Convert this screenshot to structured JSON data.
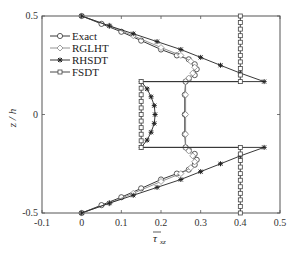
{
  "chart_data": {
    "type": "line",
    "title": "",
    "xlabel": "τ̄xz",
    "ylabel": "z / h",
    "xlim": [
      -0.1,
      0.5
    ],
    "ylim": [
      -0.5,
      0.5
    ],
    "x_ticks": [
      "-0.1",
      "0",
      "0.1",
      "0.2",
      "0.3",
      "0.4",
      "0.5"
    ],
    "y_ticks": [
      "0.5",
      "0",
      "-0.5"
    ],
    "grid": false,
    "legend_position": "upper left",
    "series": [
      {
        "name": "Exact",
        "marker": "circle",
        "points": [
          [
            0,
            0.5
          ],
          [
            0.05,
            0.46
          ],
          [
            0.1,
            0.42
          ],
          [
            0.15,
            0.375
          ],
          [
            0.2,
            0.33
          ],
          [
            0.24,
            0.3
          ],
          [
            0.27,
            0.28
          ],
          [
            0.285,
            0.255
          ],
          [
            0.29,
            0.23
          ],
          [
            0.285,
            0.2
          ],
          [
            0.27,
            0.18
          ],
          [
            0.262,
            0.167
          ],
          [
            0.26,
            0.1
          ],
          [
            0.26,
            0.0
          ],
          [
            0.26,
            -0.1
          ],
          [
            0.262,
            -0.167
          ],
          [
            0.27,
            -0.18
          ],
          [
            0.285,
            -0.2
          ],
          [
            0.29,
            -0.23
          ],
          [
            0.285,
            -0.255
          ],
          [
            0.27,
            -0.28
          ],
          [
            0.24,
            -0.3
          ],
          [
            0.2,
            -0.33
          ],
          [
            0.15,
            -0.375
          ],
          [
            0.1,
            -0.42
          ],
          [
            0.05,
            -0.46
          ],
          [
            0,
            -0.5
          ]
        ]
      },
      {
        "name": "RGLHT",
        "marker": "diamond",
        "points": [
          [
            0,
            0.5
          ],
          [
            0.07,
            0.45
          ],
          [
            0.13,
            0.4
          ],
          [
            0.2,
            0.34
          ],
          [
            0.25,
            0.3
          ],
          [
            0.275,
            0.27
          ],
          [
            0.285,
            0.24
          ],
          [
            0.28,
            0.21
          ],
          [
            0.27,
            0.185
          ],
          [
            0.262,
            0.167
          ],
          [
            0.262,
            0.1
          ],
          [
            0.262,
            0.0
          ],
          [
            0.262,
            -0.1
          ],
          [
            0.262,
            -0.167
          ],
          [
            0.27,
            -0.185
          ],
          [
            0.28,
            -0.21
          ],
          [
            0.285,
            -0.24
          ],
          [
            0.275,
            -0.27
          ],
          [
            0.25,
            -0.3
          ],
          [
            0.2,
            -0.34
          ],
          [
            0.13,
            -0.4
          ],
          [
            0.07,
            -0.45
          ],
          [
            0,
            -0.5
          ]
        ]
      },
      {
        "name": "RHSDT",
        "marker": "star",
        "points": [
          [
            0,
            0.5
          ],
          [
            0.07,
            0.45
          ],
          [
            0.13,
            0.41
          ],
          [
            0.19,
            0.37
          ],
          [
            0.25,
            0.33
          ],
          [
            0.3,
            0.29
          ],
          [
            0.35,
            0.25
          ],
          [
            0.4,
            0.21
          ],
          [
            0.46,
            0.167
          ],
          [
            0.15,
            0.167
          ],
          [
            0.165,
            0.13
          ],
          [
            0.175,
            0.09
          ],
          [
            0.183,
            0.045
          ],
          [
            0.185,
            0.0
          ],
          [
            0.183,
            -0.045
          ],
          [
            0.175,
            -0.09
          ],
          [
            0.165,
            -0.13
          ],
          [
            0.15,
            -0.167
          ],
          [
            0.46,
            -0.167
          ],
          [
            0.4,
            -0.21
          ],
          [
            0.35,
            -0.25
          ],
          [
            0.3,
            -0.29
          ],
          [
            0.25,
            -0.33
          ],
          [
            0.19,
            -0.37
          ],
          [
            0.13,
            -0.41
          ],
          [
            0.07,
            -0.45
          ],
          [
            0,
            -0.5
          ]
        ]
      },
      {
        "name": "FSDT",
        "marker": "square",
        "points": [
          [
            0.4,
            0.5
          ],
          [
            0.4,
            0.167
          ],
          [
            0.15,
            0.167
          ],
          [
            0.15,
            -0.167
          ],
          [
            0.4,
            -0.167
          ],
          [
            0.4,
            -0.5
          ]
        ]
      }
    ]
  },
  "legend": {
    "items": [
      "Exact",
      "RGLHT",
      "RHSDT",
      "FSDT"
    ]
  },
  "axes": {
    "ylabel": "z / h",
    "xlabel_main": "τ",
    "xlabel_sub": "xz"
  }
}
